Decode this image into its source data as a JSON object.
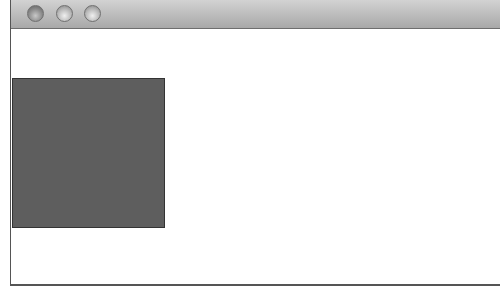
{
  "window": {
    "title": "",
    "controls": [
      {
        "name": "close",
        "icon": "close-button-icon"
      },
      {
        "name": "minimize",
        "icon": "minimize-button-icon"
      },
      {
        "name": "zoom",
        "icon": "zoom-button-icon"
      }
    ]
  },
  "content": {
    "view": {
      "fill_color": "#5e5e5e",
      "border_color": "#333333"
    }
  }
}
